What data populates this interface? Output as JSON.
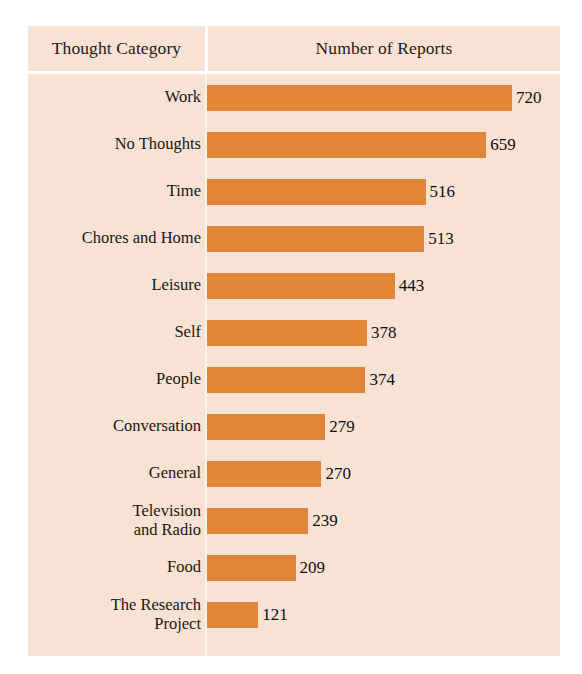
{
  "panel": {
    "background_color": "#F7E2D3",
    "bar_color": "#E18539",
    "divider_color": "#FFFFFF",
    "text_color": "#1A1715"
  },
  "header": {
    "category_label": "Thought Category",
    "reports_label": "Number of Reports"
  },
  "chart_data": {
    "type": "bar",
    "orientation": "horizontal",
    "title": "",
    "subtitle": "",
    "xlabel": "Number of Reports",
    "ylabel": "Thought Category",
    "grid": false,
    "legend": "none",
    "xlim": [
      0,
      720
    ],
    "value_labels": true,
    "categories": [
      "Work",
      "No Thoughts",
      "Time",
      "Chores and Home",
      "Leisure",
      "Self",
      "People",
      "Conversation",
      "General",
      "Television\nand Radio",
      "Food",
      "The Research\nProject"
    ],
    "values": [
      720,
      659,
      516,
      513,
      443,
      378,
      374,
      279,
      270,
      239,
      209,
      121
    ],
    "rows": [
      {
        "category": "Work",
        "value": 720,
        "value_text": "720"
      },
      {
        "category": "No Thoughts",
        "value": 659,
        "value_text": "659"
      },
      {
        "category": "Time",
        "value": 516,
        "value_text": "516"
      },
      {
        "category": "Chores and Home",
        "value": 513,
        "value_text": "513"
      },
      {
        "category": "Leisure",
        "value": 443,
        "value_text": "443"
      },
      {
        "category": "Self",
        "value": 378,
        "value_text": "378"
      },
      {
        "category": "People",
        "value": 374,
        "value_text": "374"
      },
      {
        "category": "Conversation",
        "value": 279,
        "value_text": "279"
      },
      {
        "category": "General",
        "value": 270,
        "value_text": "270"
      },
      {
        "category": "Television\nand Radio",
        "value": 239,
        "value_text": "239"
      },
      {
        "category": "Food",
        "value": 209,
        "value_text": "209"
      },
      {
        "category": "The Research\nProject",
        "value": 121,
        "value_text": "121"
      }
    ]
  }
}
